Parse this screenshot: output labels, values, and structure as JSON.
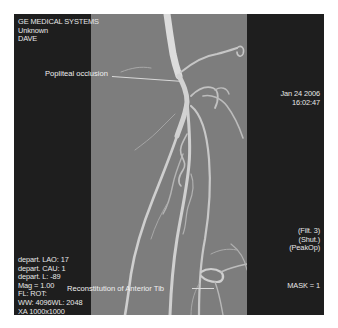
{
  "viewer": {
    "top_left": [
      "GE MEDICAL SYSTEMS",
      "Unknown",
      "DAVE"
    ],
    "top_right": [
      "Jan 24 2006",
      "16:02:47"
    ],
    "bottom_left": [
      "depart. LAO: 17",
      "depart. CAU: 1",
      "depart. L: -89",
      "Mag = 1.00",
      "FL:  ROT:",
      "WW: 4096WL: 2048",
      "XA 1000x1000"
    ],
    "bottom_right_filters": [
      "(Filt. 3)",
      "(Shut.)",
      "(PeakOp)"
    ],
    "bottom_right_mask": "MASK =  1"
  },
  "annotations": [
    {
      "label": "Popliteal occlusion",
      "target": "occlusion-point"
    },
    {
      "label": "Reconstitution of Anterior Tib",
      "target": "reconstitution-point"
    }
  ],
  "colors": {
    "panel": "#1e1e1e",
    "image_bg": "#7d7d7d",
    "vessel": "#d9d9d9",
    "text": "#e8e8e8"
  }
}
